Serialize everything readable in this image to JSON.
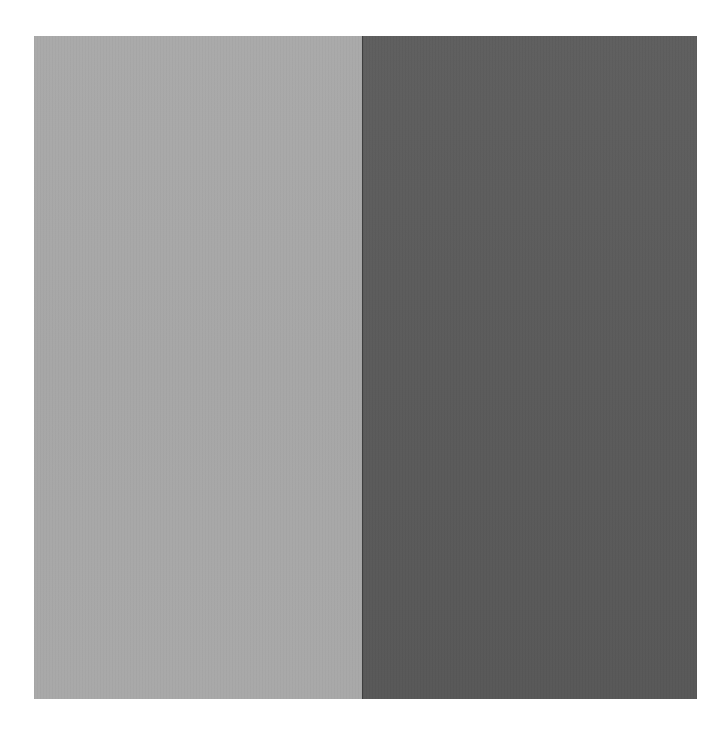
{
  "artwork": {
    "panels": [
      {
        "name": "left-panel",
        "color": "#a8a8a8"
      },
      {
        "name": "right-panel",
        "color": "#5a5a5a"
      }
    ],
    "background": "#ffffff"
  }
}
